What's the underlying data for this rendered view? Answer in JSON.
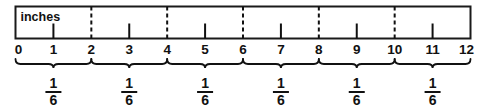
{
  "figure": {
    "type": "ruler-diagram",
    "unit_label": "inches",
    "axis": {
      "min": 0,
      "max": 12,
      "tick_labels": [
        "0",
        "1",
        "2",
        "3",
        "4",
        "5",
        "6",
        "7",
        "8",
        "9",
        "10",
        "11",
        "12"
      ],
      "major_marks": [
        0,
        2,
        4,
        6,
        8,
        10,
        12
      ],
      "minor_marks": [
        1,
        3,
        5,
        7,
        9,
        11
      ],
      "major_mark_style": "dashed-full-height",
      "minor_mark_style": "short-tick-from-bottom"
    },
    "braces": [
      {
        "start": 0,
        "end": 2,
        "numerator": "1",
        "denominator": "6"
      },
      {
        "start": 2,
        "end": 4,
        "numerator": "1",
        "denominator": "6"
      },
      {
        "start": 4,
        "end": 6,
        "numerator": "1",
        "denominator": "6"
      },
      {
        "start": 6,
        "end": 8,
        "numerator": "1",
        "denominator": "6"
      },
      {
        "start": 8,
        "end": 10,
        "numerator": "1",
        "denominator": "6"
      },
      {
        "start": 10,
        "end": 12,
        "numerator": "1",
        "denominator": "6"
      }
    ],
    "colors": {
      "background": "#ffffff",
      "ink": "#111111",
      "ruler_border": "#1a1a1a"
    }
  }
}
